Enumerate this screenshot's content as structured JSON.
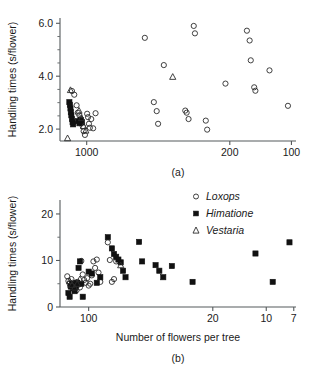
{
  "figure": {
    "panel_a_label": "(a)",
    "panel_b_label": "(b)"
  },
  "legend": {
    "position": "top-right of panel (b)",
    "items": [
      {
        "label": "Loxops",
        "marker": "open-circle"
      },
      {
        "label": "Himatione",
        "marker": "filled-square"
      },
      {
        "label": "Vestaria",
        "marker": "open-triangle"
      }
    ]
  },
  "chart_data": [
    {
      "type": "scatter",
      "panel": "(a)",
      "title": "",
      "xlabel": "",
      "ylabel": "Handling times (s/flower)",
      "xscale": "log-reversed",
      "xlim": [
        1350,
        95
      ],
      "ylim": [
        1.55,
        6.2
      ],
      "xticks": [
        1000,
        200,
        100
      ],
      "xticklabels": [
        "1000",
        "200",
        "100"
      ],
      "yticks": [
        2.0,
        4.0,
        6.0
      ],
      "yticklabels": [
        "2.0",
        "4.0",
        "6.0"
      ],
      "yminorticks": [
        2.5,
        3.0,
        3.5,
        4.5,
        5.0,
        5.5
      ],
      "grid": false,
      "series": [
        {
          "name": "Loxops",
          "marker": "open-circle",
          "points": [
            [
              1180,
              3.44
            ],
            [
              1150,
              3.3
            ],
            [
              1120,
              2.9
            ],
            [
              1105,
              2.62
            ],
            [
              1085,
              2.52
            ],
            [
              1070,
              2.4
            ],
            [
              1060,
              2.22
            ],
            [
              1045,
              2.1
            ],
            [
              1035,
              1.92
            ],
            [
              1020,
              1.78
            ],
            [
              995,
              2.58
            ],
            [
              985,
              2.45
            ],
            [
              975,
              2.2
            ],
            [
              965,
              2.05
            ],
            [
              950,
              2.38
            ],
            [
              930,
              2.03
            ],
            [
              905,
              2.6
            ],
            [
              520,
              5.45
            ],
            [
              470,
              3.02
            ],
            [
              455,
              2.68
            ],
            [
              448,
              2.2
            ],
            [
              420,
              4.42
            ],
            [
              330,
              2.7
            ],
            [
              325,
              2.62
            ],
            [
              318,
              2.38
            ],
            [
              300,
              5.9
            ],
            [
              296,
              5.62
            ],
            [
              262,
              2.32
            ],
            [
              258,
              1.98
            ],
            [
              210,
              3.72
            ],
            [
              165,
              5.72
            ],
            [
              160,
              5.35
            ],
            [
              158,
              4.6
            ],
            [
              152,
              3.58
            ],
            [
              150,
              3.45
            ],
            [
              128,
              4.22
            ],
            [
              104,
              2.88
            ]
          ]
        },
        {
          "name": "Himatione",
          "marker": "filled-square",
          "points": [
            [
              1215,
              3.02
            ],
            [
              1208,
              2.92
            ],
            [
              1200,
              2.78
            ],
            [
              1195,
              2.64
            ],
            [
              1188,
              2.52
            ],
            [
              1180,
              2.38
            ],
            [
              1172,
              2.26
            ],
            [
              1165,
              2.18
            ],
            [
              1100,
              2.3
            ],
            [
              1085,
              2.22
            ],
            [
              1070,
              2.34
            ],
            [
              1055,
              2.26
            ]
          ]
        },
        {
          "name": "Vestaria",
          "marker": "open-triangle",
          "points": [
            [
              1200,
              3.48
            ],
            [
              1090,
              2.7
            ],
            [
              1060,
              2.42
            ],
            [
              1035,
              2.12
            ],
            [
              1010,
              1.95
            ],
            [
              1240,
              1.66
            ],
            [
              380,
              3.98
            ]
          ]
        }
      ]
    },
    {
      "type": "scatter",
      "panel": "(b)",
      "title": "",
      "xlabel": "Number of flowers per tree",
      "ylabel": "Handling times (s/flower)",
      "xscale": "log-reversed",
      "xlim": [
        145,
        6.8
      ],
      "ylim": [
        0,
        23
      ],
      "xticks": [
        100,
        20,
        10,
        7
      ],
      "xticklabels": [
        "100",
        "20",
        "10",
        "7"
      ],
      "yticks": [
        0,
        10,
        20
      ],
      "yticklabels": [
        "0",
        "10",
        "20"
      ],
      "yminorticks": [
        5,
        15
      ],
      "grid": false,
      "series": [
        {
          "name": "Loxops",
          "marker": "open-circle",
          "points": [
            [
              132,
              6.6
            ],
            [
              130,
              5.6
            ],
            [
              128,
              5.0
            ],
            [
              127,
              4.4
            ],
            [
              125,
              6.0
            ],
            [
              123,
              5.2
            ],
            [
              121,
              4.6
            ],
            [
              119,
              4.0
            ],
            [
              117,
              3.6
            ],
            [
              116,
              5.4
            ],
            [
              114,
              4.8
            ],
            [
              112,
              4.2
            ],
            [
              110,
              9.9
            ],
            [
              108,
              7.0
            ],
            [
              106,
              5.8
            ],
            [
              104,
              5.2
            ],
            [
              102,
              6.2
            ],
            [
              100,
              4.6
            ],
            [
              98,
              5.0
            ],
            [
              96,
              6.8
            ],
            [
              94,
              9.8
            ],
            [
              92,
              8.4
            ],
            [
              90,
              10.2
            ],
            [
              88,
              7.4
            ],
            [
              86,
              5.4
            ],
            [
              78,
              13.9
            ],
            [
              76,
              10.1
            ],
            [
              74,
              5.4
            ],
            [
              72,
              6.0
            ],
            [
              70,
              9.8
            ]
          ]
        },
        {
          "name": "Himatione",
          "marker": "filled-square",
          "points": [
            [
              130,
              3.0
            ],
            [
              128,
              2.2
            ],
            [
              126,
              4.4
            ],
            [
              124,
              5.0
            ],
            [
              122,
              4.0
            ],
            [
              120,
              3.4
            ],
            [
              118,
              4.6
            ],
            [
              116,
              5.2
            ],
            [
              114,
              8.4
            ],
            [
              112,
              9.8
            ],
            [
              110,
              5.0
            ],
            [
              108,
              2.2
            ],
            [
              100,
              7.6
            ],
            [
              96,
              7.2
            ],
            [
              90,
              5.2
            ],
            [
              86,
              6.4
            ],
            [
              78,
              15.0
            ],
            [
              74,
              12.6
            ],
            [
              72,
              11.4
            ],
            [
              70,
              10.8
            ],
            [
              68,
              10.2
            ],
            [
              66,
              9.6
            ],
            [
              64,
              7.8
            ],
            [
              62,
              6.4
            ],
            [
              52,
              14.0
            ],
            [
              50,
              9.8
            ],
            [
              42,
              9.0
            ],
            [
              40,
              7.8
            ],
            [
              38,
              6.4
            ],
            [
              34,
              8.8
            ],
            [
              26,
              5.4
            ],
            [
              11.5,
              11.5
            ],
            [
              9.2,
              5.4
            ],
            [
              7.4,
              13.9
            ]
          ]
        },
        {
          "name": "Vestaria",
          "marker": "open-triangle",
          "points": [
            [
              128,
              5.6
            ],
            [
              124,
              4.8
            ],
            [
              120,
              4.2
            ],
            [
              116,
              5.0
            ],
            [
              112,
              6.0
            ],
            [
              66,
              9.0
            ]
          ]
        }
      ]
    }
  ]
}
